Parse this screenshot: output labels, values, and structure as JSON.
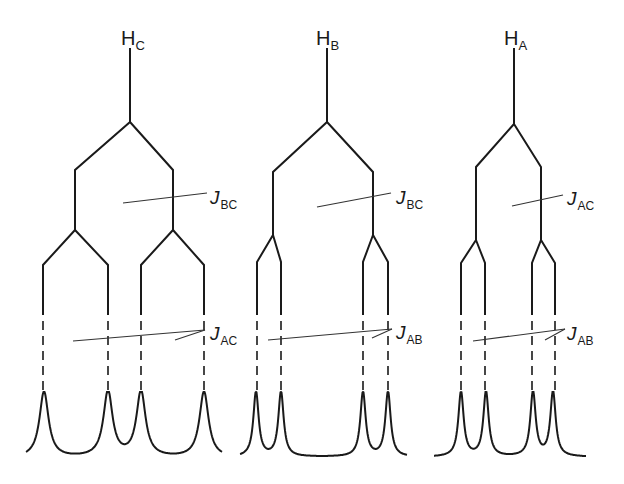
{
  "diagram": {
    "colors": {
      "ink": "#1a1a1a",
      "background": "#ffffff"
    },
    "trees": [
      {
        "id": "HC",
        "nucleus_label": "H",
        "nucleus_sub": "C",
        "label_pos": [
          121,
          28
        ],
        "stem": {
          "x": 130,
          "y_top": 48,
          "y_bottom": 122
        },
        "first_split": {
          "coupling_main": "J",
          "coupling_sub": "BC",
          "left_x": 75,
          "right_x": 173,
          "y_diag": 170,
          "y_vert_end": 230
        },
        "second_split": {
          "coupling_main": "J",
          "coupling_sub": "AC",
          "left_pair": {
            "center_x": 75,
            "left_x": 43,
            "right_x": 108
          },
          "right_pair": {
            "center_x": 173,
            "left_x": 141,
            "right_x": 204
          },
          "y_fork": 230,
          "y_diag": 265,
          "y_solid_end": 315,
          "y_dash_end": 390
        },
        "peaks_x": [
          44,
          108,
          141,
          204
        ],
        "peak_top_y": 392,
        "baseline_y": 458,
        "spectrum_x_range": [
          26,
          222
        ],
        "j1_leader": {
          "from": [
            123,
            203
          ],
          "to": [
            207,
            193
          ],
          "label_pos": [
            210,
            188
          ]
        },
        "j2_leader": {
          "long_from": [
            73,
            341
          ],
          "short_from": [
            175,
            340
          ],
          "to": [
            205,
            330
          ],
          "label_pos": [
            210,
            324
          ]
        }
      },
      {
        "id": "HB",
        "nucleus_label": "H",
        "nucleus_sub": "B",
        "label_pos": [
          316,
          28
        ],
        "stem": {
          "x": 327,
          "y_top": 48,
          "y_bottom": 122
        },
        "first_split": {
          "coupling_main": "J",
          "coupling_sub": "BC",
          "left_x": 273,
          "right_x": 373,
          "y_diag": 172,
          "y_vert_end": 235
        },
        "second_split": {
          "coupling_main": "J",
          "coupling_sub": "AB",
          "left_pair": {
            "center_x": 273,
            "left_x": 257,
            "right_x": 281
          },
          "right_pair": {
            "center_x": 373,
            "left_x": 363,
            "right_x": 388
          },
          "y_fork": 235,
          "y_diag": 262,
          "y_solid_end": 315,
          "y_dash_end": 390
        },
        "peaks_x": [
          256,
          281,
          363,
          388
        ],
        "peak_top_y": 392,
        "baseline_y": 457,
        "spectrum_x_range": [
          240,
          407
        ],
        "j1_leader": {
          "from": [
            317,
            207
          ],
          "to": [
            391,
            193
          ],
          "label_pos": [
            396,
            188
          ]
        },
        "j2_leader": {
          "long_from": [
            268,
            340
          ],
          "short_from": [
            372,
            338
          ],
          "to": [
            392,
            329
          ],
          "label_pos": [
            396,
            323
          ]
        }
      },
      {
        "id": "HA",
        "nucleus_label": "H",
        "nucleus_sub": "A",
        "label_pos": [
          504,
          28
        ],
        "stem": {
          "x": 514,
          "y_top": 48,
          "y_bottom": 124
        },
        "first_split": {
          "coupling_main": "J",
          "coupling_sub": "AC",
          "left_x": 476,
          "right_x": 541,
          "y_diag": 167,
          "y_vert_end": 236
        },
        "second_split": {
          "coupling_main": "J",
          "coupling_sub": "AB",
          "left_pair": {
            "center_x": 476,
            "left_x": 461,
            "right_x": 485
          },
          "right_pair": {
            "center_x": 541,
            "left_x": 532,
            "right_x": 555
          },
          "y_fork": 240,
          "y_diag": 263,
          "y_solid_end": 315,
          "y_dash_end": 390
        },
        "peaks_x": [
          461,
          486,
          533,
          553
        ],
        "peak_top_y": 392,
        "baseline_y": 457,
        "spectrum_x_range": [
          434,
          586
        ],
        "j1_leader": {
          "from": [
            512,
            206
          ],
          "to": [
            563,
            195
          ],
          "label_pos": [
            567,
            189
          ]
        },
        "j2_leader": {
          "long_from": [
            473,
            341
          ],
          "short_from": [
            545,
            340
          ],
          "to": [
            565,
            329
          ],
          "label_pos": [
            567,
            324
          ]
        }
      }
    ]
  }
}
